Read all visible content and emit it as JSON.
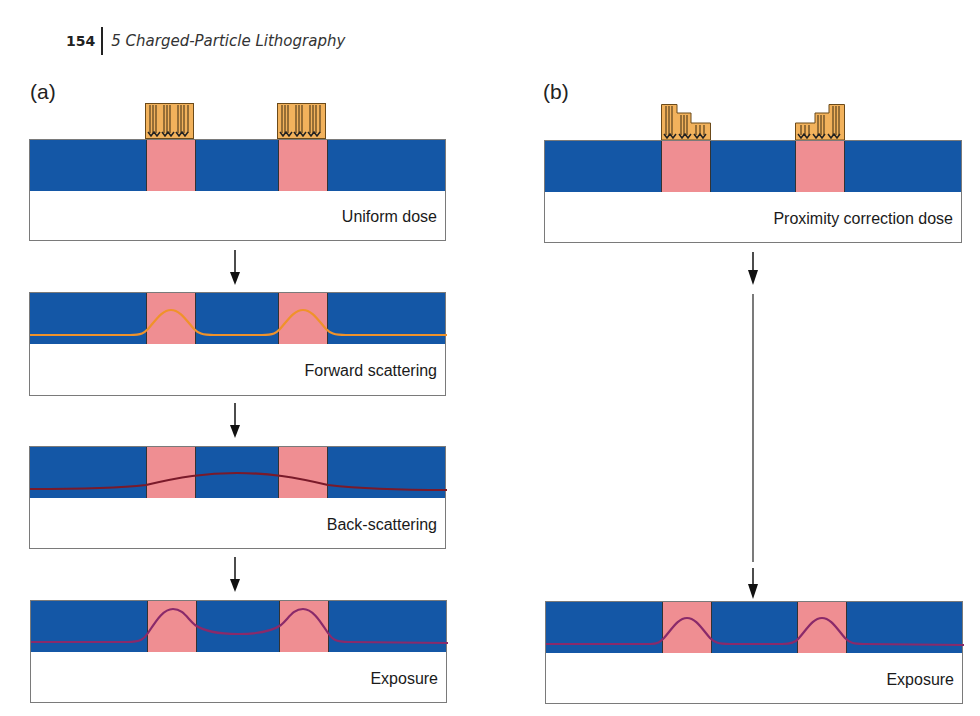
{
  "header": {
    "page_number": "154",
    "chapter_title": "5 Charged-Particle Lithography"
  },
  "panels": {
    "a": {
      "label": "(a)",
      "steps": [
        {
          "caption": "Uniform dose"
        },
        {
          "caption": "Forward scattering"
        },
        {
          "caption": "Back-scattering"
        },
        {
          "caption": "Exposure"
        }
      ]
    },
    "b": {
      "label": "(b)",
      "steps": [
        {
          "caption": "Proximity correction dose"
        },
        {
          "caption": "Exposure"
        }
      ]
    }
  },
  "colors": {
    "substrate_blue": "#1457a6",
    "exposed_pink": "#ef8e92",
    "resist_orange": "#f2b25c",
    "forward_scatter_curve": "#f0922a",
    "back_scatter_curve": "#7a1a2a",
    "exposure_curve": "#8a2a6a"
  }
}
